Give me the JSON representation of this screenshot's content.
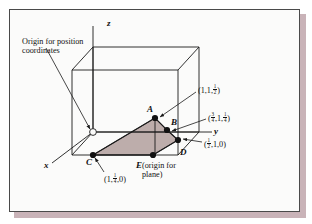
{
  "figure": {
    "type": "crystallographic-unit-cell-plane-diagram",
    "background_color": "#fbfbfa",
    "frame_border_color": "#4a4a4a",
    "shadow_color": "#c9b3b8",
    "plane_fill_color": "#b9a9a6",
    "line_color": "#1a1a1a"
  },
  "annotations": {
    "origin_note_line1": "Origin for position",
    "origin_note_line2": "coordinates",
    "origin_marker_name": "open-circle-origin-marker"
  },
  "axes": {
    "x_label": "x",
    "y_label": "y",
    "z_label": "z"
  },
  "points": [
    {
      "id": "A",
      "label": "A"
    },
    {
      "id": "B",
      "label": "B"
    },
    {
      "id": "C",
      "label": "C"
    },
    {
      "id": "D",
      "label": "D"
    },
    {
      "id": "E",
      "label": "E"
    }
  ],
  "coordinate_labels": {
    "A": {
      "open": "(1,1,",
      "frac_num": "1",
      "frac_den": "2",
      "close": ")"
    },
    "B": {
      "open": "(",
      "f1_num": "3",
      "f1_den": "4",
      "mid": ",1,",
      "f2_num": "1",
      "f2_den": "4",
      "close": ")"
    },
    "D": {
      "open": "(",
      "f1_num": "1",
      "f1_den": "2",
      "close": ",1,0)"
    },
    "C": {
      "open": "(1,",
      "f1_num": "1",
      "f1_den": "4",
      "close": ",0)"
    }
  },
  "e_label": {
    "point": "E",
    "line1": "(origin for",
    "line2": "plane)"
  }
}
